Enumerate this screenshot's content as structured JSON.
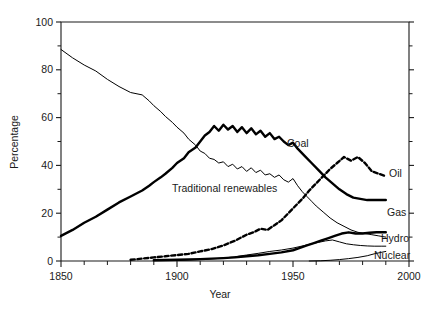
{
  "chart_data": {
    "type": "line",
    "title": "",
    "xlabel": "Year",
    "ylabel": "Percentage",
    "xlim": [
      1850,
      2000
    ],
    "ylim": [
      0,
      100
    ],
    "grid": false,
    "legend_position": "inline-end-of-line",
    "x_ticks_major": [
      1850,
      1900,
      1950,
      2000
    ],
    "x_ticks_minor_step": 10,
    "y_ticks_major": [
      0,
      20,
      40,
      60,
      80,
      100
    ],
    "y_ticks_minor_step": 10,
    "x_tick_labels": [
      "1850",
      "1900",
      "1950",
      "2000"
    ],
    "y_tick_labels": [
      "0",
      "20",
      "40",
      "60",
      "80",
      "100"
    ],
    "series": [
      {
        "name": "Traditional renewables",
        "label": "Traditional renewables",
        "style": "thin-solid",
        "x": [
          1850,
          1855,
          1860,
          1865,
          1870,
          1875,
          1880,
          1885,
          1888,
          1890,
          1893,
          1895,
          1898,
          1900,
          1903,
          1905,
          1908,
          1910,
          1912,
          1914,
          1916,
          1918,
          1920,
          1922,
          1924,
          1926,
          1928,
          1930,
          1932,
          1934,
          1936,
          1938,
          1940,
          1942,
          1944,
          1946,
          1948,
          1950,
          1952,
          1954,
          1956,
          1958,
          1960,
          1963,
          1966,
          1969,
          1972,
          1975,
          1978,
          1981,
          1984,
          1987,
          1990
        ],
        "values": [
          88.5,
          85.0,
          82.0,
          79.5,
          76.0,
          73.0,
          70.5,
          69.5,
          67.0,
          65.0,
          62.5,
          60.5,
          58.0,
          56.0,
          53.5,
          51.0,
          48.5,
          46.0,
          45.0,
          43.0,
          42.5,
          41.0,
          41.5,
          39.5,
          40.5,
          38.5,
          39.5,
          37.5,
          39.0,
          37.0,
          38.0,
          36.0,
          36.5,
          35.0,
          36.0,
          34.0,
          33.0,
          34.5,
          31.5,
          29.0,
          27.0,
          25.0,
          23.0,
          20.5,
          18.0,
          16.0,
          14.5,
          13.0,
          12.0,
          11.5,
          11.0,
          10.5,
          10.0
        ]
      },
      {
        "name": "Coal",
        "label": "Coal",
        "style": "bold-solid",
        "x": [
          1850,
          1855,
          1860,
          1865,
          1870,
          1875,
          1880,
          1885,
          1888,
          1890,
          1893,
          1895,
          1898,
          1900,
          1903,
          1905,
          1908,
          1910,
          1912,
          1914,
          1916,
          1918,
          1920,
          1922,
          1924,
          1926,
          1928,
          1930,
          1932,
          1934,
          1936,
          1938,
          1940,
          1942,
          1944,
          1946,
          1948,
          1950,
          1952,
          1955,
          1958,
          1961,
          1964,
          1967,
          1970,
          1973,
          1976,
          1979,
          1982,
          1985,
          1988,
          1990
        ],
        "values": [
          10.5,
          13.0,
          16.0,
          18.5,
          21.5,
          24.5,
          27.0,
          29.5,
          31.5,
          33.0,
          35.0,
          36.5,
          39.0,
          41.0,
          43.0,
          45.5,
          47.5,
          50.0,
          52.5,
          54.0,
          56.5,
          54.5,
          57.0,
          55.0,
          56.5,
          54.0,
          56.0,
          53.5,
          55.5,
          53.0,
          54.5,
          52.0,
          53.5,
          51.0,
          52.0,
          50.0,
          48.5,
          49.5,
          47.0,
          44.0,
          41.0,
          38.0,
          35.0,
          32.5,
          30.0,
          28.0,
          26.5,
          26.0,
          25.5,
          25.5,
          25.5,
          25.5
        ]
      },
      {
        "name": "Oil",
        "label": "Oil",
        "style": "bold-dashed",
        "x": [
          1880,
          1885,
          1890,
          1895,
          1900,
          1905,
          1910,
          1915,
          1920,
          1925,
          1930,
          1933,
          1936,
          1939,
          1942,
          1945,
          1948,
          1951,
          1954,
          1957,
          1960,
          1963,
          1966,
          1969,
          1972,
          1975,
          1978,
          1981,
          1984,
          1987,
          1990
        ],
        "values": [
          0.5,
          1.0,
          1.5,
          2.0,
          2.5,
          3.0,
          4.0,
          5.0,
          6.5,
          8.5,
          11.0,
          12.0,
          13.5,
          13.0,
          15.0,
          17.0,
          20.0,
          23.0,
          26.0,
          29.5,
          32.5,
          35.5,
          38.5,
          41.0,
          43.5,
          42.0,
          43.5,
          41.0,
          37.5,
          36.5,
          35.5
        ]
      },
      {
        "name": "Gas",
        "label": "Gas",
        "style": "bold-solid",
        "x": [
          1890,
          1900,
          1910,
          1920,
          1925,
          1930,
          1935,
          1940,
          1945,
          1950,
          1953,
          1956,
          1959,
          1962,
          1965,
          1968,
          1971,
          1974,
          1977,
          1980,
          1983,
          1986,
          1990
        ],
        "values": [
          0.3,
          0.5,
          0.8,
          1.2,
          1.5,
          2.0,
          2.4,
          3.0,
          3.6,
          4.5,
          5.5,
          6.5,
          7.5,
          8.5,
          9.5,
          10.5,
          11.5,
          12.0,
          11.5,
          11.5,
          11.8,
          12.0,
          12.0
        ]
      },
      {
        "name": "Hydro",
        "label": "Hydro",
        "style": "thin-solid",
        "x": [
          1900,
          1910,
          1920,
          1925,
          1930,
          1935,
          1940,
          1945,
          1950,
          1955,
          1958,
          1961,
          1964,
          1967,
          1970,
          1973,
          1976,
          1979,
          1982,
          1985,
          1988,
          1990
        ],
        "values": [
          0.2,
          0.6,
          1.2,
          1.8,
          2.5,
          3.2,
          4.0,
          4.6,
          5.4,
          6.5,
          7.2,
          7.8,
          8.4,
          8.8,
          8.0,
          7.2,
          6.8,
          6.5,
          6.3,
          6.2,
          6.2,
          6.2
        ]
      },
      {
        "name": "Nuclear",
        "label": "Nuclear",
        "style": "thin-solid",
        "x": [
          1957,
          1962,
          1966,
          1970,
          1974,
          1978,
          1982,
          1985,
          1988,
          1990
        ],
        "values": [
          0.0,
          0.1,
          0.3,
          0.6,
          1.0,
          1.5,
          2.2,
          3.0,
          3.6,
          4.0
        ]
      }
    ],
    "annotations": [
      {
        "text": "Coal",
        "x_px": 287,
        "y_px": 147
      },
      {
        "text": "Oil",
        "x_px": 389,
        "y_px": 177
      },
      {
        "text": "Traditional renewables",
        "x_px": 172,
        "y_px": 192
      },
      {
        "text": "Gas",
        "x_px": 387,
        "y_px": 216
      },
      {
        "text": "Hydro",
        "x_px": 381,
        "y_px": 242
      },
      {
        "text": "Nuclear",
        "x_px": 374,
        "y_px": 259
      }
    ]
  },
  "plot_geometry": {
    "left_px": 61,
    "right_px": 409,
    "top_px": 22,
    "bottom_px": 261
  },
  "colors": {
    "ink": "#000000",
    "background": "#ffffff",
    "axis": "#1a1a1a"
  }
}
